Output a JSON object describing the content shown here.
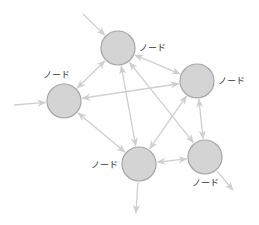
{
  "diagram": {
    "type": "directed-network",
    "colors": {
      "node_fill": "#d4d4d4",
      "node_stroke": "#a6a6a6",
      "edge": "#cfcfcf",
      "label": "#333333"
    },
    "nodes": [
      {
        "id": "top",
        "label": "ノード",
        "label_side": "right"
      },
      {
        "id": "right",
        "label": "ノード",
        "label_side": "right"
      },
      {
        "id": "left",
        "label": "ノード",
        "label_side": "top"
      },
      {
        "id": "bottom",
        "label": "ノード",
        "label_side": "left"
      },
      {
        "id": "bottom-right",
        "label": "ノード",
        "label_side": "bottom"
      }
    ],
    "edges": [
      {
        "from": "external",
        "to": "top",
        "direction": "forward"
      },
      {
        "from": "external",
        "to": "left",
        "direction": "forward"
      },
      {
        "from": "top",
        "to": "left",
        "direction": "both"
      },
      {
        "from": "top",
        "to": "right",
        "direction": "both"
      },
      {
        "from": "top",
        "to": "bottom",
        "direction": "both"
      },
      {
        "from": "top",
        "to": "bottom-right",
        "direction": "both"
      },
      {
        "from": "right",
        "to": "left",
        "direction": "both"
      },
      {
        "from": "right",
        "to": "bottom",
        "direction": "both"
      },
      {
        "from": "right",
        "to": "bottom-right",
        "direction": "both"
      },
      {
        "from": "left",
        "to": "bottom",
        "direction": "both"
      },
      {
        "from": "bottom",
        "to": "bottom-right",
        "direction": "both"
      },
      {
        "from": "bottom",
        "to": "external",
        "direction": "forward"
      },
      {
        "from": "bottom-right",
        "to": "external",
        "direction": "forward"
      }
    ]
  }
}
